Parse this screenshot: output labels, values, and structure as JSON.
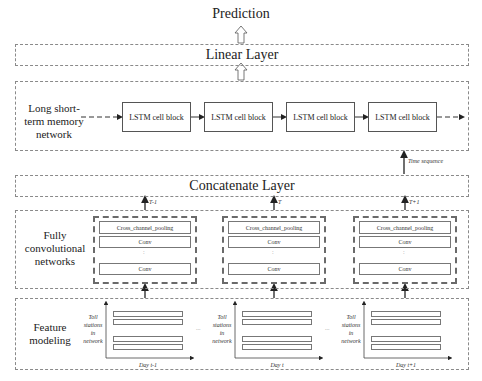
{
  "title": "Prediction",
  "layers": {
    "linear": {
      "label": "Linear Layer"
    },
    "lstm": {
      "label_lines": [
        "Long short-",
        "term memory",
        "network"
      ],
      "blocks": [
        "LSTM cell block",
        "LSTM cell block",
        "LSTM cell block",
        "LSTM cell block"
      ]
    },
    "time_sequence_label": "Time sequence",
    "concatenate": {
      "label": "Concatenate Layer"
    },
    "fcn": {
      "label_lines": [
        "Fully",
        "convolutional",
        "networks"
      ],
      "groups": [
        {
          "time_label": "T-1",
          "pooling": "Cross_channel_pooling",
          "conv_top": "Conv",
          "dots": ":",
          "conv_bottom": "Conv"
        },
        {
          "time_label": "T",
          "pooling": "Cross_channel_pooling",
          "conv_top": "Conv",
          "dots": ":",
          "conv_bottom": "Conv"
        },
        {
          "time_label": "T+1",
          "pooling": "Cross_channel_pooling",
          "conv_top": "Conv",
          "dots": ":",
          "conv_bottom": "Conv"
        }
      ]
    },
    "feature": {
      "label_lines": [
        "Feature",
        "modeling"
      ],
      "ellipsis": "...",
      "panels": [
        {
          "y_label_lines": [
            "Toll",
            "stations",
            "in",
            "network"
          ],
          "x_label": "Day t-1"
        },
        {
          "y_label_lines": [
            "Toll",
            "stations",
            "in",
            "network"
          ],
          "x_label": "Day t"
        },
        {
          "y_label_lines": [
            "Toll",
            "stations",
            "in",
            "network"
          ],
          "x_label": "Day t+1"
        }
      ]
    }
  },
  "colors": {
    "line": "#555555",
    "dash": "#8a8a8a",
    "text": "#222222"
  }
}
